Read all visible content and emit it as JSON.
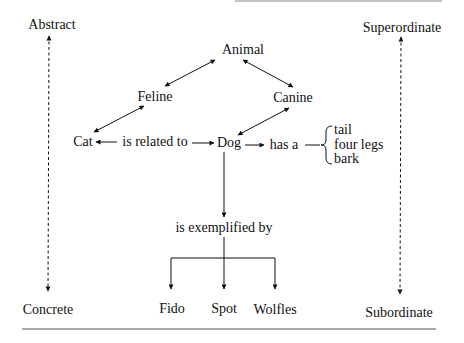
{
  "diagram": {
    "scale_left": {
      "top": "Abstract",
      "bottom": "Concrete"
    },
    "scale_right": {
      "top": "Superordinate",
      "bottom": "Subordinate"
    },
    "nodes": {
      "animal": "Animal",
      "feline": "Feline",
      "canine": "Canine",
      "cat": "Cat",
      "dog": "Dog",
      "exemplified": "is exemplified by",
      "fido": "Fido",
      "spot": "Spot",
      "wolfles": "Wolfles"
    },
    "relations": {
      "related": "is related to",
      "has_a": "has a"
    },
    "attributes": [
      "tail",
      "four legs",
      "bark"
    ],
    "edges": [
      {
        "from": "Animal",
        "to": "Feline",
        "type": "bidirectional"
      },
      {
        "from": "Animal",
        "to": "Canine",
        "type": "bidirectional"
      },
      {
        "from": "Feline",
        "to": "Cat",
        "type": "bidirectional"
      },
      {
        "from": "Canine",
        "to": "Dog",
        "type": "bidirectional"
      },
      {
        "from": "Cat",
        "to": "Dog",
        "label": "is related to",
        "type": "bidirectional"
      },
      {
        "from": "Dog",
        "to": "attributes",
        "label": "has a",
        "type": "directed"
      },
      {
        "from": "Dog",
        "to": "is exemplified by",
        "type": "directed"
      },
      {
        "from": "is exemplified by",
        "to": "Fido",
        "type": "directed"
      },
      {
        "from": "is exemplified by",
        "to": "Spot",
        "type": "directed"
      },
      {
        "from": "is exemplified by",
        "to": "Wolfles",
        "type": "directed"
      }
    ]
  }
}
